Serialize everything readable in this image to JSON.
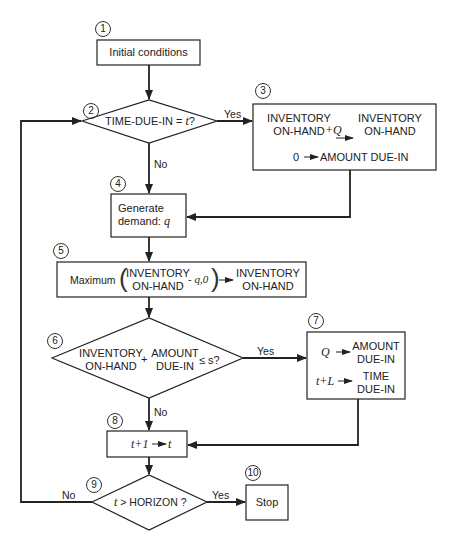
{
  "diagram": {
    "type": "flowchart",
    "nodes": [
      {
        "id": "1",
        "shape": "process",
        "text": "Initial conditions"
      },
      {
        "id": "2",
        "shape": "decision",
        "text_pre": "TIME-DUE-IN = ",
        "var": "t",
        "text_post": "?"
      },
      {
        "id": "3",
        "shape": "process",
        "line1_left": "INVENTORY",
        "line2_left": "ON-HAND",
        "op": "+Q",
        "line1_right": "INVENTORY",
        "line2_right": "ON-HAND",
        "line3_left": "0",
        "line3_right": "AMOUNT DUE-IN"
      },
      {
        "id": "4",
        "shape": "process",
        "line1": "Generate",
        "line2_pre": "demand:",
        "line2_var": "q"
      },
      {
        "id": "5",
        "shape": "process",
        "prefix": "Maximum",
        "inner1": "INVENTORY",
        "inner2": "ON-HAND",
        "inner_op": "- q,0",
        "right1": "INVENTORY",
        "right2": "ON-HAND"
      },
      {
        "id": "6",
        "shape": "decision",
        "a1": "INVENTORY",
        "a2": "ON-HAND",
        "plus": "+",
        "b1": "AMOUNT",
        "b2": "DUE-IN",
        "cond": "≤ s?"
      },
      {
        "id": "7",
        "shape": "process",
        "r1_left": "Q",
        "r1_right1": "AMOUNT",
        "r1_right2": "DUE-IN",
        "r2_left": "t+L",
        "r2_right1": "TIME",
        "r2_right2": "DUE-IN"
      },
      {
        "id": "8",
        "shape": "process",
        "left": "t+1",
        "right": "t"
      },
      {
        "id": "9",
        "shape": "decision",
        "var": "t",
        "text": " > HORIZON ?"
      },
      {
        "id": "10",
        "shape": "process",
        "text": "Stop"
      }
    ],
    "edge_labels": {
      "d2_yes": "Yes",
      "d2_no": "No",
      "d6_yes": "Yes",
      "d6_no": "No",
      "d9_yes": "Yes",
      "d9_no": "No"
    },
    "colors": {
      "line": "#222222",
      "background": "#ffffff"
    }
  }
}
